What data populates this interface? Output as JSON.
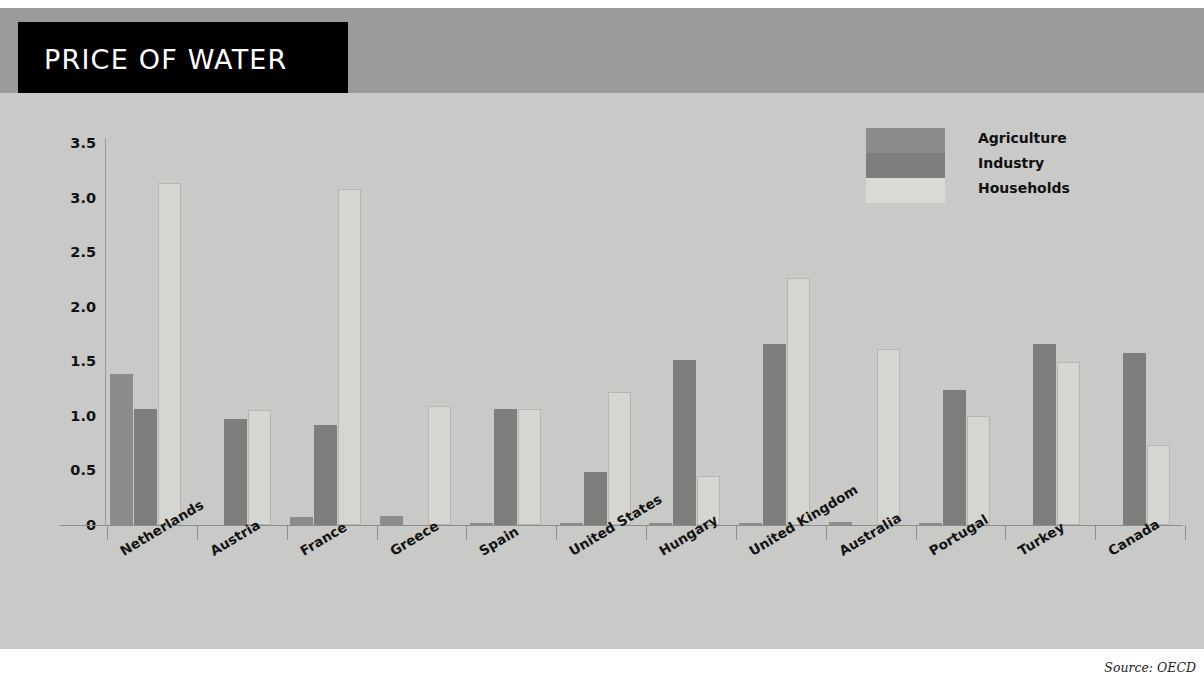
{
  "header": {
    "title": "PRICE OF WATER",
    "title_bg": "#000000",
    "band_bg": "#9b9b9b"
  },
  "source_note": "Source: OECD",
  "source_prefix": "Source:",
  "colors": {
    "background": "#c9c9c7",
    "agriculture": "#8c8c8a",
    "industry": "#7e7e7c",
    "households": "#d5d5d2",
    "axis": "#8f8f8d",
    "text": "#111111"
  },
  "chart_data": {
    "type": "bar",
    "title": "PRICE OF WATER",
    "xlabel": "",
    "ylabel": "Price in US$ per cubic meter (1999)",
    "ylim": [
      0,
      3.5
    ],
    "yticks": [
      "0",
      "0.5",
      "1.0",
      "1.5",
      "2.0",
      "2.5",
      "3.0",
      "3.5"
    ],
    "ytick_values": [
      0,
      0.5,
      1.0,
      1.5,
      2.0,
      2.5,
      3.0,
      3.5
    ],
    "grid": false,
    "legend_position": "top-right",
    "categories": [
      "Netherlands",
      "Austria",
      "France",
      "Greece",
      "Spain",
      "United States",
      "Hungary",
      "United Kingdom",
      "Australia",
      "Portugal",
      "Turkey",
      "Canada"
    ],
    "series": [
      {
        "name": "Agriculture",
        "color": "#8c8c8a",
        "values": [
          1.38,
          0.0,
          0.07,
          0.08,
          0.02,
          0.02,
          0.02,
          0.02,
          0.03,
          0.02,
          0.0,
          0.0
        ]
      },
      {
        "name": "Industry",
        "color": "#7e7e7c",
        "values": [
          1.06,
          0.97,
          0.92,
          0.0,
          1.06,
          0.49,
          1.51,
          1.66,
          0.0,
          1.24,
          1.66,
          1.58
        ]
      },
      {
        "name": "Households",
        "color": "#d5d5d2",
        "values": [
          3.13,
          1.05,
          3.08,
          1.09,
          1.06,
          1.22,
          0.45,
          2.26,
          1.61,
          1.0,
          1.49,
          0.73
        ]
      }
    ]
  }
}
